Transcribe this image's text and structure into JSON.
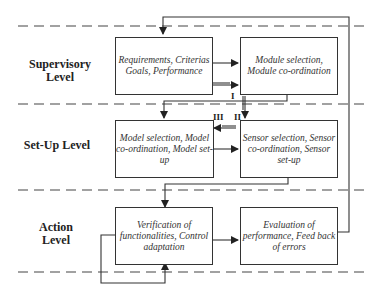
{
  "levels": {
    "supervisory": "Supervisory Level",
    "setup": "Set-Up Level",
    "action": "Action Level"
  },
  "boxes": {
    "requirements": "Requirements, Criterias Goals, Performance",
    "module": "Module selection, Module co-ordination",
    "model": "Model selection, Model co-ordination, Model set-up",
    "sensor": "Sensor selection, Sensor co-ordination, Sensor set-up",
    "verification": "Verification of functionalities, Control adaptation",
    "evaluation": "Evaluation of performance, Feed back of errors"
  },
  "labels": {
    "i": "I",
    "ii": "II",
    "iii": "III"
  }
}
